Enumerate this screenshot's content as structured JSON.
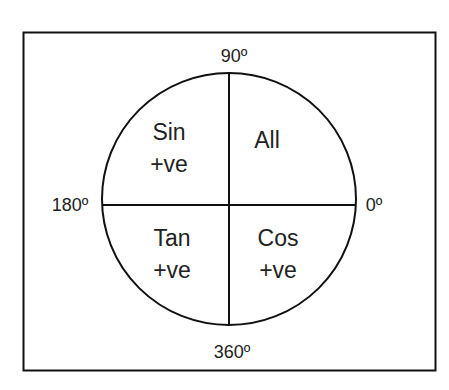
{
  "diagram": {
    "type": "CAST trigonometry quadrant diagram",
    "angles": {
      "top": "90º",
      "left": "180º",
      "right": "0º",
      "bottom": "360º"
    },
    "quadrants": {
      "top_left": {
        "func": "Sin",
        "sign": "+ve"
      },
      "top_right": {
        "func": "All",
        "sign": ""
      },
      "bottom_left": {
        "func": "Tan",
        "sign": "+ve"
      },
      "bottom_right": {
        "func": "Cos",
        "sign": "+ve"
      }
    },
    "colors": {
      "stroke": "#111111",
      "text": "#222222",
      "background": "#ffffff"
    }
  }
}
